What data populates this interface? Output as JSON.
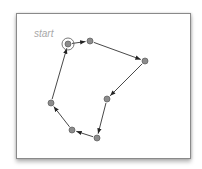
{
  "diagram": {
    "type": "directed-cycle",
    "start_label": "start",
    "colors": {
      "node_fill": "#8c8c8c",
      "node_stroke": "#5a5a5a",
      "edge": "#333333",
      "label": "#a8a8a8",
      "frame_border": "#8a8a8a"
    },
    "nodes": [
      {
        "id": "n1",
        "x": 68,
        "y": 44,
        "start": true
      },
      {
        "id": "n2",
        "x": 90,
        "y": 41
      },
      {
        "id": "n3",
        "x": 145,
        "y": 61
      },
      {
        "id": "n4",
        "x": 107,
        "y": 99
      },
      {
        "id": "n5",
        "x": 97,
        "y": 138
      },
      {
        "id": "n6",
        "x": 72,
        "y": 130
      },
      {
        "id": "n7",
        "x": 51,
        "y": 103
      }
    ],
    "edges": [
      {
        "from": "n1",
        "to": "n2"
      },
      {
        "from": "n2",
        "to": "n3"
      },
      {
        "from": "n3",
        "to": "n4"
      },
      {
        "from": "n4",
        "to": "n5"
      },
      {
        "from": "n5",
        "to": "n6"
      },
      {
        "from": "n6",
        "to": "n7"
      },
      {
        "from": "n7",
        "to": "n1"
      }
    ]
  }
}
